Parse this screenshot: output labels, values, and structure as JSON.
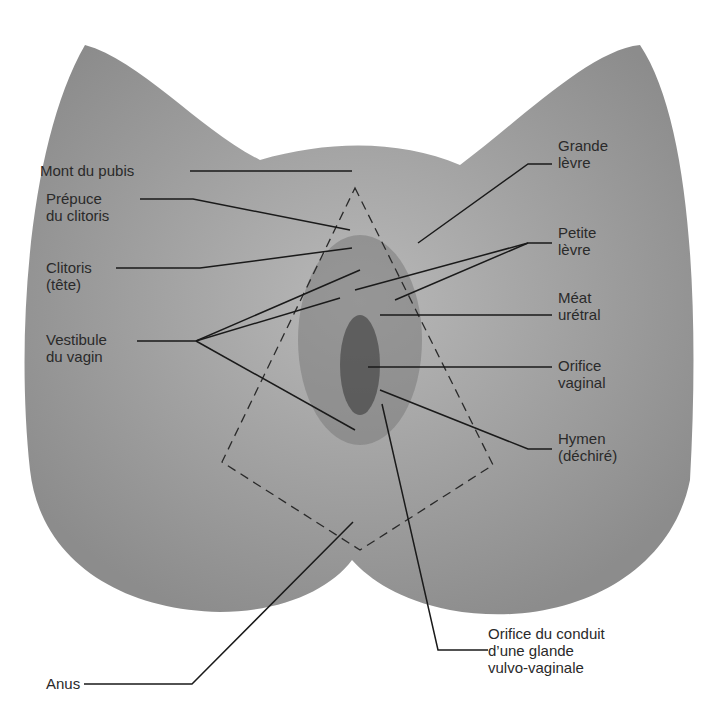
{
  "diagram": {
    "type": "anatomical-illustration",
    "colors": {
      "background": "#ffffff",
      "tissue": "#9a9a9a",
      "tissue_light": "#b5b5b5",
      "leader_line": "#1a1a1a",
      "dashed_outline": "#2a2a2a"
    },
    "labels": {
      "mont_pubis": "Mont du pubis",
      "prepuce": "Prépuce\ndu clitoris",
      "clitoris": "Clitoris\n(tête)",
      "vestibule": "Vestibule\ndu vagin",
      "anus": "Anus",
      "grande_levre": "Grande\nlèvre",
      "petite_levre": "Petite\nlèvre",
      "meat": "Méat\nurétral",
      "orifice_vaginal": "Orifice\nvaginal",
      "hymen": "Hymen\n(déchiré)",
      "glande": "Orifice du conduit\nd’une glande\nvulvo-vaginale"
    }
  }
}
